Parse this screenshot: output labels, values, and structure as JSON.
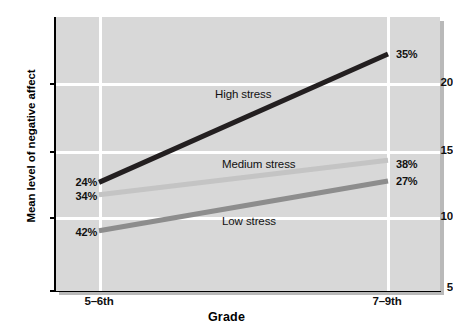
{
  "chart_data": {
    "type": "line",
    "title": "",
    "xlabel": "Grade",
    "ylabel": "Mean level of negative affect",
    "categories": [
      "5–6th",
      "7–9th"
    ],
    "x": [
      0,
      1
    ],
    "xlim": [
      -0.155,
      1.0
    ],
    "ylim": [
      5,
      24.3
    ],
    "yticks": [
      5,
      10,
      15,
      20
    ],
    "ytick_labels": [
      "5",
      "10",
      "15",
      "20"
    ],
    "xtick_labels": [
      "5–6th",
      "7–9th"
    ],
    "grid": true,
    "legend": "inline-annotations",
    "series": [
      {
        "name": "High stress",
        "label": "High stress",
        "color": "#231f20",
        "values": [
          12.8,
          22.1
        ],
        "point_labels": [
          "24%",
          "35%"
        ]
      },
      {
        "name": "Medium stress",
        "label": "Medium stress",
        "color": "#c4c4c4",
        "values": [
          11.9,
          14.4
        ],
        "point_labels": [
          "34%",
          "38%"
        ]
      },
      {
        "name": "Low stress",
        "label": "Low stress",
        "color": "#8d8d8d",
        "values": [
          9.3,
          12.9
        ],
        "point_labels": [
          "42%",
          "27%"
        ]
      }
    ],
    "annotations": [
      {
        "text": "High stress",
        "x": 215,
        "y": 88
      },
      {
        "text": "Medium stress",
        "x": 222,
        "y": 158
      },
      {
        "text": "Low stress",
        "x": 222,
        "y": 215
      }
    ],
    "panel_background": "#d8d8d8",
    "gridline_color": "#ffffff",
    "axis_color": "#000000"
  },
  "axes": {
    "y_title": "Mean level of negative affect",
    "x_title": "Grade",
    "y_ticks": [
      "20",
      "15",
      "10",
      "5"
    ],
    "x_ticks": [
      "5–6th",
      "7–9th"
    ]
  },
  "labels": {
    "high_left": "24%",
    "high_right": "35%",
    "medium_left": "34%",
    "medium_right": "38%",
    "low_left": "42%",
    "low_right": "27%",
    "high_series": "High stress",
    "medium_series": "Medium stress",
    "low_series": "Low stress"
  }
}
